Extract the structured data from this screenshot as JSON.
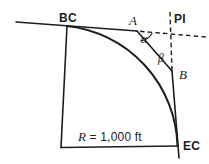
{
  "labels": {
    "begin_of_curve": "BC",
    "point_a": "A",
    "point_of_intersection": "PI",
    "angle_alpha": "α",
    "angle_beta": "β",
    "point_b": "B",
    "radius_symbol": "R",
    "radius_value": "= 1,000 ft",
    "end_of_curve": "EC"
  },
  "colors": {
    "line": "#1d1d1b",
    "background": "#ffffff"
  }
}
